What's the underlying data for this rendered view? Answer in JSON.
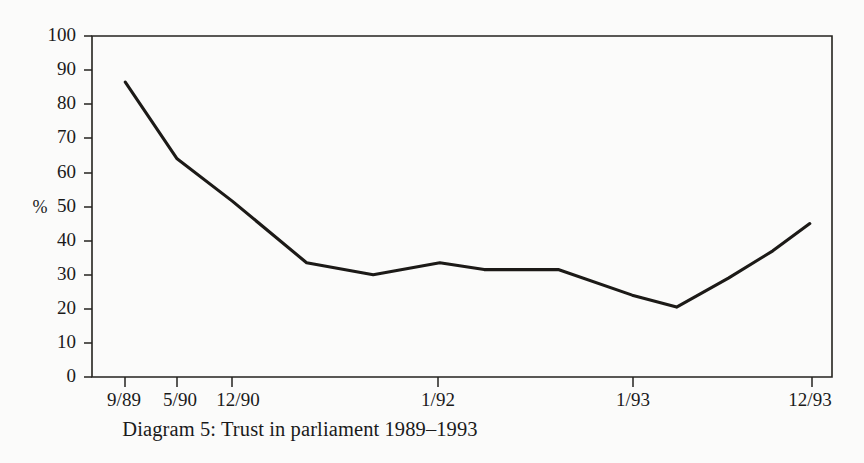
{
  "figure": {
    "caption": "Diagram 5: Trust in parliament 1989–1993",
    "axis_label_y": "%",
    "ink_color": "#1c1a17",
    "background_color": "#fbfbfa"
  },
  "chart_data": {
    "type": "line",
    "title": "Diagram 5: Trust in parliament 1989–1993",
    "xlabel": "",
    "ylabel": "%",
    "ylim": [
      0,
      100
    ],
    "ytick_labels": [
      "0",
      "10",
      "20",
      "30",
      "40",
      "50",
      "60",
      "70",
      "80",
      "90",
      "100"
    ],
    "ytick_values": [
      0,
      10,
      20,
      30,
      40,
      50,
      60,
      70,
      80,
      90,
      100
    ],
    "xtick_labels": [
      "9/89",
      "5/90",
      "12/90",
      "1/92",
      "1/93",
      "12/93"
    ],
    "xtick_positions": [
      0.0,
      0.07,
      0.19,
      0.47,
      0.73,
      0.97
    ],
    "grid": false,
    "legend": "none",
    "series": [
      {
        "name": "Trust in parliament",
        "x": [
          "9/89",
          "5/90",
          "12/90",
          "",
          "",
          "",
          "1/92",
          "",
          "",
          "1/93",
          "",
          "",
          "12/93"
        ],
        "x_frac": [
          0.045,
          0.115,
          0.19,
          0.29,
          0.38,
          0.47,
          0.53,
          0.63,
          0.73,
          0.79,
          0.86,
          0.92,
          0.97
        ],
        "values": [
          86.5,
          64,
          51.5,
          33.5,
          30,
          33.5,
          31.5,
          31.5,
          24,
          20.5,
          29,
          37,
          45
        ]
      }
    ]
  },
  "axis": {
    "y_values": [
      100,
      90,
      80,
      70,
      60,
      50,
      40,
      30,
      20,
      10,
      0
    ],
    "x_values": [
      "9/89",
      "5/90",
      "12/90",
      "1/92",
      "1/93",
      "12/93"
    ]
  }
}
